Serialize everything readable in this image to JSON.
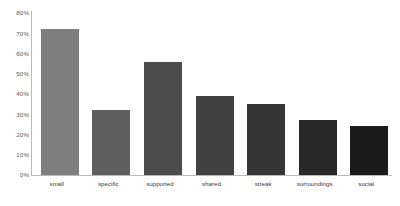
{
  "chart_data": {
    "type": "bar",
    "title": "",
    "subtitle": "",
    "xlabel": "",
    "ylabel": "",
    "categories": [
      "small",
      "specific",
      "supported",
      "shared",
      "streak",
      "surroundings",
      "social"
    ],
    "values": [
      72,
      32,
      56,
      39,
      35,
      27,
      24
    ],
    "value_labels": [
      "72%",
      "32%",
      "56%",
      "39%",
      "35%",
      "27%",
      "24%"
    ],
    "series": [
      {
        "name": "percentage",
        "values": [
          72,
          32,
          56,
          39,
          35,
          27,
          24
        ]
      }
    ],
    "bar_colors": [
      "#7f7f7f",
      "#5e5e5e",
      "#4c4c4c",
      "#414141",
      "#363636",
      "#282828",
      "#1b1b1b"
    ],
    "ylim": [
      0,
      80
    ],
    "ytick_values": [
      0,
      10,
      20,
      30,
      40,
      50,
      60,
      70,
      80
    ],
    "ytick_labels": [
      "0%",
      "10%",
      "20%",
      "30%",
      "40%",
      "50%",
      "60%",
      "70%",
      "80%"
    ],
    "grid": false,
    "legend": "none",
    "axis_color": "#b9b9b9",
    "background": "#ffffff",
    "tick_text_color": "#585858",
    "label_text_color": "#3a3a3a"
  }
}
